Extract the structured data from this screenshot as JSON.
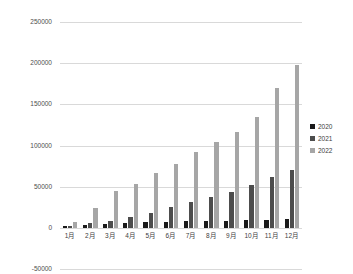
{
  "chart_data": {
    "type": "bar",
    "title": "",
    "xlabel": "",
    "ylabel": "",
    "categories": [
      "1月",
      "2月",
      "3月",
      "4月",
      "5月",
      "6月",
      "7月",
      "8月",
      "9月",
      "10月",
      "11月",
      "12月"
    ],
    "series": [
      {
        "name": "2020",
        "color": "#1a1a1a",
        "values": [
          2500,
          4000,
          5000,
          6500,
          7000,
          7500,
          8000,
          8500,
          9000,
          9500,
          10000,
          10500
        ]
      },
      {
        "name": "2021",
        "color": "#4d4d4d",
        "values": [
          3000,
          6000,
          8000,
          13000,
          18000,
          25000,
          31000,
          38000,
          44000,
          52000,
          62000,
          70000
        ]
      },
      {
        "name": "2022",
        "color": "#a6a6a6",
        "values": [
          7000,
          24000,
          45000,
          54000,
          67000,
          78000,
          92000,
          104000,
          117000,
          135000,
          170000,
          198000
        ]
      }
    ],
    "ylim": [
      -50000,
      250000
    ],
    "ytick_labels": [
      "250000",
      "200000",
      "150000",
      "100000",
      "50000",
      "0",
      "-50000"
    ],
    "ytick_values": [
      250000,
      200000,
      150000,
      100000,
      50000,
      0,
      -50000
    ],
    "grid": true,
    "legend_position": "right"
  },
  "legend": {
    "entries": [
      {
        "label": "2020",
        "color": "#1a1a1a"
      },
      {
        "label": "2021",
        "color": "#4d4d4d"
      },
      {
        "label": "2022",
        "color": "#a6a6a6"
      }
    ]
  }
}
